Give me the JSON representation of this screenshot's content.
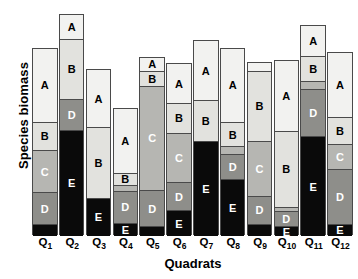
{
  "chart_data": {
    "type": "bar",
    "subtype": "stacked-bar",
    "title": "",
    "xlabel": "Quadrats",
    "ylabel": "Species biomass",
    "grid": false,
    "legend": "none (segments labelled in place)",
    "axis_note": "y axis has no tick marks or numeric labels; values are relative segment heights in pixels",
    "categories": [
      "Q1",
      "Q2",
      "Q3",
      "Q4",
      "Q5",
      "Q6",
      "Q7",
      "Q8",
      "Q9",
      "Q10",
      "Q11",
      "Q12"
    ],
    "category_tick_labels": [
      {
        "base": "Q",
        "sub": "1"
      },
      {
        "base": "Q",
        "sub": "2"
      },
      {
        "base": "Q",
        "sub": "3"
      },
      {
        "base": "Q",
        "sub": "4"
      },
      {
        "base": "Q",
        "sub": "5"
      },
      {
        "base": "Q",
        "sub": "6"
      },
      {
        "base": "Q",
        "sub": "7"
      },
      {
        "base": "Q",
        "sub": "8"
      },
      {
        "base": "Q",
        "sub": "9"
      },
      {
        "base": "Q",
        "sub": "10"
      },
      {
        "base": "Q",
        "sub": "11"
      },
      {
        "base": "Q",
        "sub": "12"
      }
    ],
    "species": [
      "A",
      "B",
      "C",
      "D",
      "E"
    ],
    "species_colors": {
      "A": "#f2f2f0",
      "B": "#e2e2de",
      "C": "#b6b6b2",
      "D": "#8e8e8a",
      "E": "#0a0a0a"
    },
    "series": [
      {
        "name": "A",
        "values": [
          66,
          22,
          52,
          58,
          13,
          35,
          54,
          66,
          8,
          63,
          27,
          58
        ]
      },
      {
        "name": "B",
        "values": [
          25,
          54,
          63,
          10,
          13,
          27,
          36,
          22,
          62,
          68,
          23,
          24
        ]
      },
      {
        "name": "C",
        "values": [
          38,
          0,
          0,
          6,
          93,
          44,
          0,
          7,
          49,
          4,
          7,
          22
        ]
      },
      {
        "name": "D",
        "values": [
          28,
          27,
          0,
          28,
          32,
          25,
          0,
          22,
          25,
          13,
          42,
          49
        ]
      },
      {
        "name": "E",
        "values": [
          10,
          94,
          33,
          11,
          8,
          22,
          84,
          50,
          10,
          8,
          88,
          10
        ]
      }
    ],
    "bar_totals": [
      167,
      197,
      148,
      113,
      159,
      153,
      174,
      167,
      154,
      156,
      187,
      163
    ],
    "segment_labels": [
      [
        "A",
        "B",
        "C",
        "D",
        ""
      ],
      [
        "A",
        "B",
        "",
        "D",
        "E"
      ],
      [
        "A",
        "B",
        "",
        "",
        "E"
      ],
      [
        "A",
        "B",
        "",
        "D",
        "E"
      ],
      [
        "A",
        "B",
        "C",
        "D",
        ""
      ],
      [
        "A",
        "B",
        "C",
        "D",
        "E"
      ],
      [
        "A",
        "B",
        "",
        "",
        "E"
      ],
      [
        "A",
        "B",
        "",
        "D",
        "E"
      ],
      [
        "",
        "B",
        "C",
        "D",
        ""
      ],
      [
        "A",
        "B",
        "",
        "D",
        "E"
      ],
      [
        "A",
        "B",
        "",
        "D",
        "E"
      ],
      [
        "A",
        "B",
        "C",
        "D",
        "E"
      ]
    ]
  }
}
